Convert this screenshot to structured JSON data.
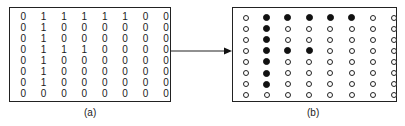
{
  "figure": {
    "panel_a": {
      "label": "(a)",
      "matrix": [
        [
          0,
          1,
          1,
          1,
          1,
          1,
          0,
          0
        ],
        [
          0,
          1,
          0,
          0,
          0,
          0,
          0,
          0
        ],
        [
          0,
          1,
          0,
          0,
          0,
          0,
          0,
          0
        ],
        [
          0,
          1,
          1,
          1,
          0,
          0,
          0,
          0
        ],
        [
          0,
          1,
          0,
          0,
          0,
          0,
          0,
          0
        ],
        [
          0,
          1,
          0,
          0,
          0,
          0,
          0,
          0
        ],
        [
          0,
          1,
          0,
          0,
          0,
          0,
          0,
          0
        ],
        [
          0,
          0,
          0,
          0,
          0,
          0,
          0,
          0
        ]
      ]
    },
    "panel_b": {
      "label": "(b)",
      "description": "dot-matrix rendering of panel (a): filled dot = 1, open dot = 0"
    },
    "arrow": "maps binary matrix (a) to dot pattern (b)",
    "colors": {
      "ink": "#111111",
      "background": "#ffffff"
    }
  }
}
